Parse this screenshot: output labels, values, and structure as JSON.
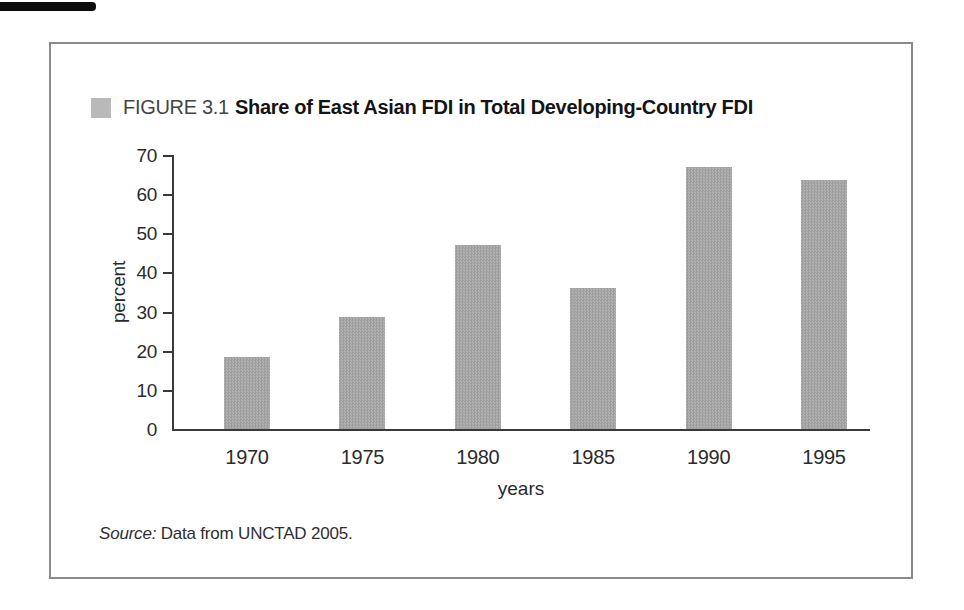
{
  "figure": {
    "label": "FIGURE 3.1",
    "title": "Share of East Asian FDI in Total Developing-Country FDI"
  },
  "source": {
    "prefix": "Source:",
    "text": " Data from UNCTAD 2005."
  },
  "colors": {
    "bar": "#a8a8a8",
    "marker": "#b9b9b9",
    "axis": "#3a3a3a",
    "text": "#2b2b2b",
    "box_border": "#8a8a8a",
    "scan_mark": "#0c0c0c"
  },
  "chart_data": {
    "type": "bar",
    "title": "FIGURE 3.1 Share of East Asian FDI in Total Developing-Country FDI",
    "categories": [
      "1970",
      "1975",
      "1980",
      "1985",
      "1990",
      "1995"
    ],
    "values": [
      18.5,
      28.5,
      47,
      36,
      67,
      63.5
    ],
    "xlabel": "years",
    "ylabel": "percent",
    "ylim": [
      0,
      70
    ],
    "yticks": [
      0,
      10,
      20,
      30,
      40,
      50,
      60,
      70
    ],
    "grid": false,
    "legend": "none",
    "source": "Data from UNCTAD 2005"
  }
}
